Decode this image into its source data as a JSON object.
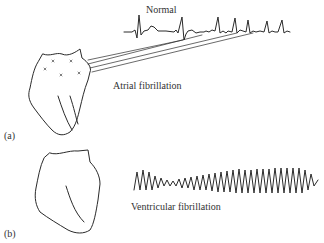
{
  "figure": {
    "panel_a": {
      "label": "(a)",
      "trace_label": "Normal",
      "condition_label": "Atrial fibrillation"
    },
    "panel_b": {
      "label": "(b)",
      "condition_label": "Ventricular fibrillation"
    }
  }
}
